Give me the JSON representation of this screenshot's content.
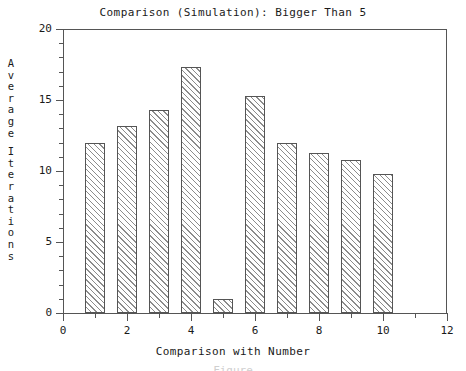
{
  "chart_data": {
    "type": "bar",
    "title": "Comparison (Simulation): Bigger Than 5",
    "xlabel": "Comparison with Number",
    "ylabel": "Average Iterations",
    "categories": [
      1,
      2,
      3,
      4,
      5,
      6,
      7,
      8,
      9,
      10
    ],
    "values": [
      12.0,
      13.2,
      14.3,
      17.3,
      1.0,
      15.3,
      12.0,
      11.3,
      10.8,
      9.8
    ],
    "series": [
      {
        "name": "Average Iterations",
        "values": [
          12.0,
          13.2,
          14.3,
          17.3,
          1.0,
          15.3,
          12.0,
          11.3,
          10.8,
          9.8
        ]
      }
    ],
    "xlim": [
      0,
      12
    ],
    "ylim": [
      0,
      20
    ],
    "x_ticks_major": [
      0,
      2,
      4,
      6,
      8,
      10,
      12
    ],
    "x_tick_labels": [
      "0",
      "2",
      "4",
      "6",
      "8",
      "10",
      "12"
    ],
    "x_ticks_minor": [
      1,
      3,
      5,
      7,
      9,
      11
    ],
    "y_ticks_major": [
      0,
      5,
      10,
      15,
      20
    ],
    "y_tick_labels": [
      "0",
      "5",
      "10",
      "15",
      "20"
    ],
    "y_ticks_minor": [
      1,
      2,
      3,
      4,
      6,
      7,
      8,
      9,
      11,
      12,
      13,
      14,
      16,
      17,
      18,
      19
    ],
    "bar_width": 0.65,
    "bar_fill": "hatched-diagonal",
    "grid": false,
    "legend": null,
    "colors": {
      "axis": "#555555",
      "bar_edge": "#555555",
      "bar_hatch": "#8c8c8c",
      "bar_face": "#ffffff",
      "text": "#1a1a1a",
      "background": "#ffffff"
    }
  },
  "ylabel_letters": [
    "A",
    "v",
    "e",
    "r",
    "a",
    "g",
    "e",
    "",
    "I",
    "t",
    "e",
    "r",
    "a",
    "t",
    "i",
    "o",
    "n",
    "s"
  ],
  "caption": {
    "cut_off_text": "Figure"
  }
}
